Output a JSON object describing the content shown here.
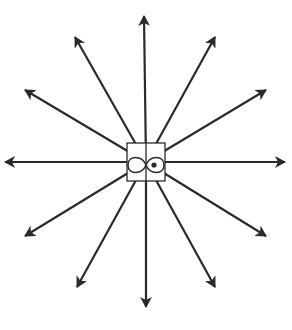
{
  "diagram": {
    "center": {
      "x": 146,
      "y": 162
    },
    "center_box": {
      "x": 127,
      "y": 143,
      "width": 38,
      "height": 38,
      "divider_x": 146
    },
    "center_symbol": "infinity-loop-with-dot",
    "arrows": [
      {
        "name": "arrow-up",
        "tip": [
          144,
          16
        ]
      },
      {
        "name": "arrow-up-right-steep",
        "tip": [
          215,
          37
        ]
      },
      {
        "name": "arrow-up-right-shallow",
        "tip": [
          266,
          90
        ]
      },
      {
        "name": "arrow-right",
        "tip": [
          285,
          162
        ]
      },
      {
        "name": "arrow-down-right-shallow",
        "tip": [
          266,
          236
        ]
      },
      {
        "name": "arrow-down-right-steep",
        "tip": [
          215,
          287
        ]
      },
      {
        "name": "arrow-down",
        "tip": [
          146,
          307
        ]
      },
      {
        "name": "arrow-down-left-steep",
        "tip": [
          77,
          287
        ]
      },
      {
        "name": "arrow-down-left-shallow",
        "tip": [
          25,
          236
        ]
      },
      {
        "name": "arrow-left",
        "tip": [
          5,
          162
        ]
      },
      {
        "name": "arrow-up-left-shallow",
        "tip": [
          25,
          90
        ]
      },
      {
        "name": "arrow-up-left-steep",
        "tip": [
          75,
          37
        ]
      }
    ],
    "colors": {
      "stroke": "#2a2a2a",
      "background": "#ffffff"
    }
  }
}
